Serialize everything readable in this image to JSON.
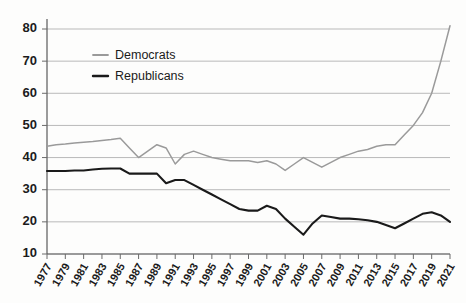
{
  "chart_data": {
    "type": "line",
    "title": "",
    "subtitle": "",
    "xlabel": "",
    "ylabel": "",
    "x": [
      1977,
      1978,
      1979,
      1980,
      1981,
      1982,
      1983,
      1984,
      1985,
      1986,
      1987,
      1988,
      1989,
      1990,
      1991,
      1992,
      1993,
      1994,
      1995,
      1996,
      1997,
      1998,
      1999,
      2000,
      2001,
      2002,
      2003,
      2004,
      2005,
      2006,
      2007,
      2008,
      2009,
      2010,
      2011,
      2012,
      2013,
      2014,
      2015,
      2016,
      2017,
      2018,
      2019,
      2020,
      2021
    ],
    "tick_labels": [
      "1977",
      "1979",
      "1981",
      "1983",
      "1985",
      "1987",
      "1989",
      "1991",
      "1993",
      "1995",
      "1997",
      "1999",
      "2001",
      "2003",
      "2005",
      "2007",
      "2009",
      "2011",
      "2013",
      "2015",
      "2017",
      "2019",
      "2021"
    ],
    "ytick_labels": [
      "10",
      "20",
      "30",
      "40",
      "50",
      "60",
      "70",
      "80"
    ],
    "yticks": [
      10,
      20,
      30,
      40,
      50,
      60,
      70,
      80
    ],
    "ylim": [
      10,
      84
    ],
    "xlim": [
      1977,
      2021
    ],
    "grid": true,
    "legend_position": "top-left-inside",
    "series": [
      {
        "name": "Democrats",
        "color": "#9a9a9a",
        "values": [
          43.5,
          44,
          44.2,
          44.5,
          44.8,
          45,
          45.3,
          45.6,
          46,
          43,
          40,
          42,
          44,
          43,
          38,
          41,
          42,
          41,
          40,
          39.5,
          39,
          39,
          39,
          38.5,
          39,
          38,
          36,
          38,
          40,
          38.5,
          37,
          38.5,
          40,
          41,
          42,
          42.5,
          43.5,
          44,
          44,
          47,
          50,
          54,
          60,
          70,
          81
        ]
      },
      {
        "name": "Republicans",
        "color": "#1a1a1a",
        "values": [
          35.8,
          35.8,
          35.8,
          36,
          36,
          36.3,
          36.5,
          36.6,
          36.6,
          35,
          35,
          35,
          35,
          32,
          33,
          33,
          31.5,
          30,
          28.5,
          27,
          25.5,
          24,
          23.5,
          23.5,
          25,
          24,
          21,
          18.5,
          16,
          19.5,
          22,
          21.5,
          21,
          21,
          20.8,
          20.5,
          20,
          19,
          18,
          19.5,
          21,
          22.5,
          23,
          22,
          20
        ]
      }
    ]
  },
  "legend": {
    "items": [
      {
        "label": "Democrats",
        "color": "#9a9a9a"
      },
      {
        "label": "Republicans",
        "color": "#1a1a1a"
      }
    ]
  }
}
